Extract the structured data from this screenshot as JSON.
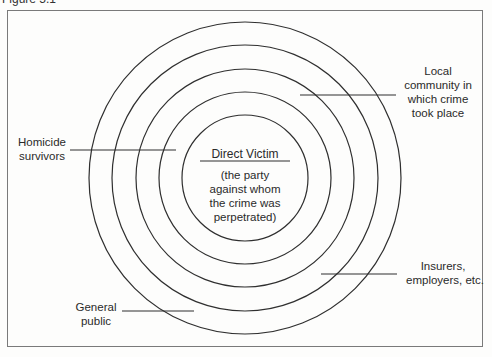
{
  "figure": {
    "title": "Figure 5.1"
  },
  "diagram": {
    "type": "concentric-circles",
    "center": {
      "title": "Direct Victim",
      "description_lines": [
        "(the party",
        "against whom",
        "the crime was",
        "perpetrated)"
      ]
    },
    "labels": {
      "local_community": [
        "Local",
        "community in",
        "which crime",
        "took place"
      ],
      "homicide_survivors": [
        "Homicide",
        "survivors"
      ],
      "insurers": [
        "Insurers,",
        "employers, etc."
      ],
      "general_public": [
        "General",
        "public"
      ]
    },
    "ring_count": 5,
    "stroke_color": "#2f2f2f",
    "frame_color": "#7a7a7a"
  }
}
